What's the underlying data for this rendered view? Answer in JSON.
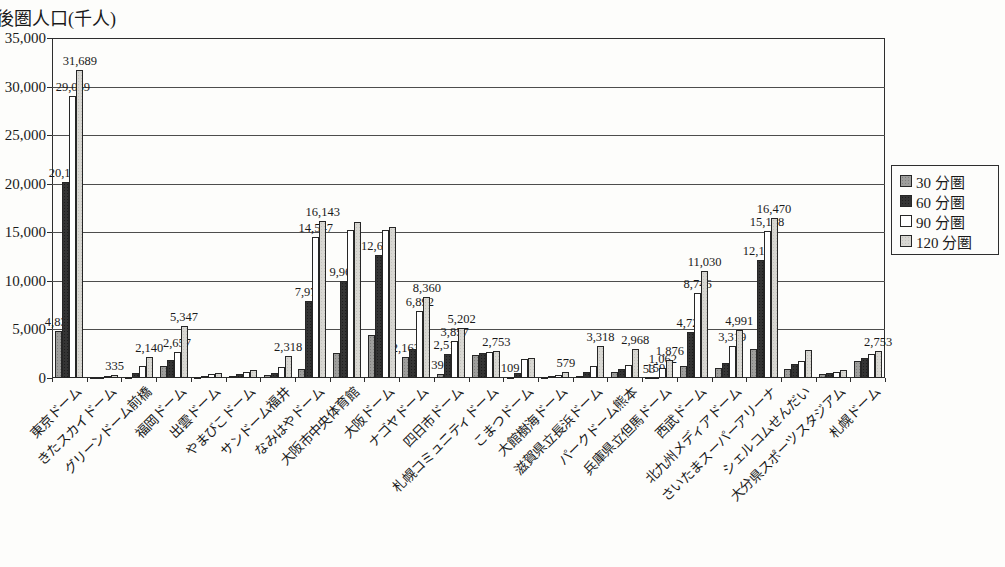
{
  "title": "後圏人口(千人)",
  "legend": {
    "items": [
      {
        "label": "30 分圏",
        "color_class": "fill-s0",
        "color": "#9e9e9c"
      },
      {
        "label": "60 分圏",
        "color_class": "fill-s1",
        "color": "#343434"
      },
      {
        "label": "90 分圏",
        "color_class": "fill-s2",
        "color": "#ffffff"
      },
      {
        "label": "120 分圏",
        "color_class": "fill-s3",
        "color": "#d8d7d2"
      }
    ]
  },
  "y_axis": {
    "tick_labels": [
      "0",
      "5,000",
      "10,000",
      "15,000",
      "20,000",
      "25,000",
      "30,000",
      "35,000"
    ],
    "min": 0,
    "max": 35000,
    "step": 5000
  },
  "chart_data": {
    "type": "bar",
    "title": "後圏人口(千人)",
    "ylim": [
      0,
      35000
    ],
    "grid": true,
    "legend_position": "right",
    "categories": [
      "東京ドーム",
      "きたスカイドーム",
      "グリーンドーム前橋",
      "福岡ドーム",
      "出雲ドーム",
      "やまびこドーム",
      "サンドーム福井",
      "なみはやドーム",
      "大阪市中央体育館",
      "大阪ドーム",
      "ナゴヤドーム",
      "四日市ドーム",
      "札幌コミュニティドーム",
      "こまつドーム",
      "大館樹海ドーム",
      "滋賀県立長浜ドーム",
      "パークドーム熊本",
      "兵庫県立但馬ドーム",
      "西武ドーム",
      "北九州メディアドーム",
      "さいたまスーパーアリーナ",
      "シェルコムせんだい",
      "大分県スポーツスタジアム",
      "札幌ドーム"
    ],
    "series": [
      {
        "name": "30分圏",
        "values": [
          4830,
          60,
          150,
          1250,
          120,
          200,
          300,
          950,
          2550,
          4400,
          2163,
          392,
          2400,
          109,
          80,
          250,
          620,
          53,
          1230,
          1000,
          3000,
          900,
          450,
          1750
        ]
      },
      {
        "name": "60分圏",
        "values": [
          20136,
          150,
          550,
          1850,
          250,
          400,
          550,
          7972,
          9965,
          12679,
          2950,
          2519,
          2550,
          550,
          160,
          600,
          930,
          159,
          4726,
          1550,
          12198,
          1400,
          500,
          2060
        ]
      },
      {
        "name": "90分圏",
        "values": [
          29069,
          250,
          1250,
          2657,
          380,
          600,
          1150,
          14547,
          15200,
          15200,
          6892,
          3857,
          2650,
          1950,
          280,
          1250,
          1340,
          1062,
          8746,
          3319,
          15178,
          1750,
          620,
          2470
        ]
      },
      {
        "name": "120分圏",
        "values": [
          31689,
          335,
          2140,
          5347,
          480,
          800,
          2318,
          16143,
          16100,
          15550,
          8360,
          5202,
          2753,
          2100,
          579,
          3318,
          2968,
          1876,
          11030,
          4991,
          16470,
          2900,
          800,
          2753
        ]
      }
    ],
    "data_labels": [
      {
        "category_index": 0,
        "series_index": 0,
        "text": "4,830"
      },
      {
        "category_index": 0,
        "series_index": 1,
        "text": "20,136"
      },
      {
        "category_index": 0,
        "series_index": 2,
        "text": "29,069"
      },
      {
        "category_index": 0,
        "series_index": 3,
        "text": "31,689"
      },
      {
        "category_index": 1,
        "series_index": 3,
        "text": "335"
      },
      {
        "category_index": 2,
        "series_index": 3,
        "text": "2,140"
      },
      {
        "category_index": 3,
        "series_index": 2,
        "text": "2,657"
      },
      {
        "category_index": 3,
        "series_index": 3,
        "text": "5,347"
      },
      {
        "category_index": 6,
        "series_index": 3,
        "text": "2,318"
      },
      {
        "category_index": 7,
        "series_index": 1,
        "text": "7,972"
      },
      {
        "category_index": 7,
        "series_index": 2,
        "text": "14,547"
      },
      {
        "category_index": 7,
        "series_index": 3,
        "text": "16,143"
      },
      {
        "category_index": 8,
        "series_index": 1,
        "text": "9,965"
      },
      {
        "category_index": 9,
        "series_index": 1,
        "text": "12,679"
      },
      {
        "category_index": 10,
        "series_index": 0,
        "text": "2,163"
      },
      {
        "category_index": 10,
        "series_index": 2,
        "text": "6,892"
      },
      {
        "category_index": 10,
        "series_index": 3,
        "text": "8,360"
      },
      {
        "category_index": 11,
        "series_index": 0,
        "text": "392"
      },
      {
        "category_index": 11,
        "series_index": 1,
        "text": "2,519"
      },
      {
        "category_index": 11,
        "series_index": 2,
        "text": "3,857"
      },
      {
        "category_index": 11,
        "series_index": 3,
        "text": "5,202"
      },
      {
        "category_index": 12,
        "series_index": 3,
        "text": "2,753"
      },
      {
        "category_index": 13,
        "series_index": 0,
        "text": "109"
      },
      {
        "category_index": 14,
        "series_index": 3,
        "text": "579"
      },
      {
        "category_index": 15,
        "series_index": 3,
        "text": "3,318"
      },
      {
        "category_index": 16,
        "series_index": 3,
        "text": "2,968"
      },
      {
        "category_index": 17,
        "series_index": 0,
        "text": "53"
      },
      {
        "category_index": 17,
        "series_index": 1,
        "text": "159"
      },
      {
        "category_index": 17,
        "series_index": 2,
        "text": "1,062"
      },
      {
        "category_index": 17,
        "series_index": 3,
        "text": "1,876"
      },
      {
        "category_index": 18,
        "series_index": 1,
        "text": "4,726"
      },
      {
        "category_index": 18,
        "series_index": 2,
        "text": "8,746"
      },
      {
        "category_index": 18,
        "series_index": 3,
        "text": "11,030"
      },
      {
        "category_index": 19,
        "series_index": 2,
        "text": "3,319"
      },
      {
        "category_index": 19,
        "series_index": 3,
        "text": "4,991"
      },
      {
        "category_index": 20,
        "series_index": 1,
        "text": "12,198"
      },
      {
        "category_index": 20,
        "series_index": 2,
        "text": "15,178"
      },
      {
        "category_index": 20,
        "series_index": 3,
        "text": "16,470"
      },
      {
        "category_index": 23,
        "series_index": 3,
        "text": "2,753"
      }
    ]
  }
}
